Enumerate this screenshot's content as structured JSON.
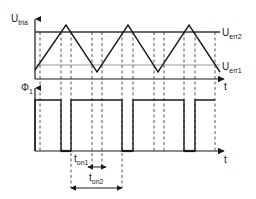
{
  "top_plot": {
    "y_axis_label": "U",
    "y_axis_subscript": "tria",
    "x_axis_label": "t",
    "upper_threshold_label": "U",
    "upper_threshold_subscript": "err2",
    "lower_threshold_label": "U",
    "lower_threshold_subscript": "err1"
  },
  "bottom_plot": {
    "y_axis_label": "Φ",
    "y_axis_subscript": "1",
    "x_axis_label": "t"
  },
  "annotations": {
    "ton1_label": "t",
    "ton1_subscript": "on1",
    "ton2_label": "t",
    "ton2_subscript": "on2"
  },
  "colors": {
    "line": "#1a1a1a",
    "threshold_upper": "#333333",
    "threshold_lower": "#999999",
    "dashed": "#444444"
  }
}
